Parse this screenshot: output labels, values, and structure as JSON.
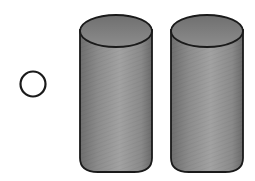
{
  "figure": {
    "background": "#ffffff",
    "stroke_color": "#1a1a1a",
    "circle": {
      "cx": 33,
      "cy": 84,
      "r": 12.5,
      "fill": "none"
    },
    "cylinders": [
      {
        "x": 80,
        "width": 72,
        "top": 14,
        "bottom": 172,
        "cap_ry": 16,
        "body_fill": "#8a8a8a",
        "cap_fill": "#7a7a7a"
      },
      {
        "x": 171,
        "width": 72,
        "top": 14,
        "bottom": 172,
        "cap_ry": 16,
        "body_fill": "#8a8a8a",
        "cap_fill": "#7a7a7a"
      }
    ]
  }
}
